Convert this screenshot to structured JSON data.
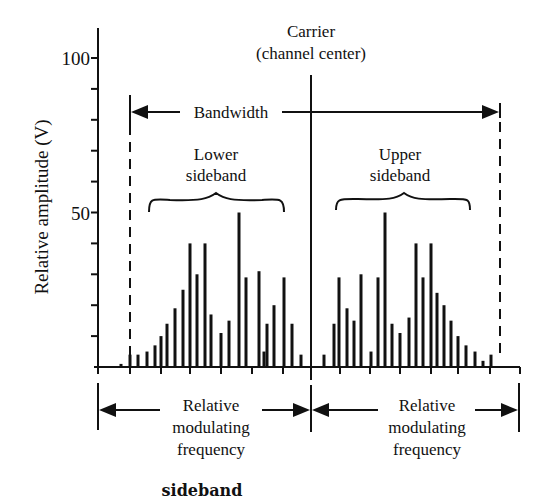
{
  "figure": {
    "caption": "sideband",
    "carrier_label_line1": "Carrier",
    "carrier_label_line2": "(channel center)",
    "bandwidth_label": "Bandwidth",
    "lower_sideband_line1": "Lower",
    "lower_sideband_line2": "sideband",
    "upper_sideband_line1": "Upper",
    "upper_sideband_line2": "sideband",
    "left_freq_label": [
      "Relative",
      "modulating",
      "frequency"
    ],
    "right_freq_label": [
      "Relative",
      "modulating",
      "frequency"
    ],
    "colors": {
      "ink": "#111111",
      "background": "#ffffff"
    }
  },
  "chart_data": {
    "type": "bar",
    "title": "sideband",
    "xlabel": "Relative modulating frequency",
    "ylabel": "Relative amplitude (V)",
    "ylim": [
      0,
      100
    ],
    "yticks": [
      0,
      10,
      20,
      30,
      40,
      50,
      60,
      70,
      80,
      90,
      100
    ],
    "ytick_labels": [
      {
        "value": 50,
        "label": "50"
      },
      {
        "value": 100,
        "label": "100"
      }
    ],
    "grid": false,
    "carrier": {
      "x_px": 311,
      "label": "Carrier (channel center)",
      "amplitude": "extends above 100"
    },
    "series": [
      {
        "name": "Lower sideband",
        "x_px": [
          121,
          130,
          138,
          147,
          155,
          161,
          167,
          175,
          183,
          190,
          197,
          205,
          211,
          221,
          229,
          239,
          246,
          259,
          264,
          267,
          274,
          284,
          292,
          301
        ],
        "values": [
          1,
          4,
          4,
          5,
          7,
          10,
          14,
          19,
          25,
          40,
          30,
          40,
          17,
          11,
          15,
          50,
          29,
          31,
          5,
          14,
          20,
          29,
          14,
          4
        ]
      },
      {
        "name": "Upper sideband",
        "x_px": [
          324,
          334,
          339,
          347,
          354,
          361,
          371,
          378,
          385,
          392,
          400,
          409,
          416,
          423,
          431,
          437,
          444,
          451,
          458,
          466,
          475,
          483,
          491
        ],
        "values": [
          4,
          14,
          29,
          19,
          15,
          30,
          5,
          29,
          50,
          14,
          11,
          16,
          40,
          29,
          40,
          24,
          20,
          15,
          10,
          7,
          5,
          2,
          4
        ]
      }
    ],
    "bandwidth_markers_px": [
      130,
      500
    ],
    "annotations": [
      "Bandwidth",
      "Lower sideband",
      "Upper sideband",
      "Carrier (channel center)",
      "Relative modulating frequency",
      "Relative modulating frequency"
    ]
  }
}
